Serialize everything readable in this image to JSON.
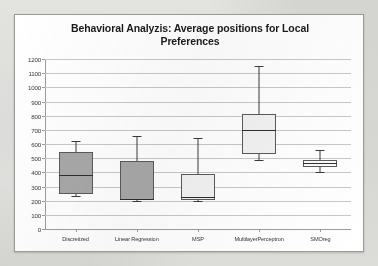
{
  "chart_data": {
    "type": "box",
    "title": "Behavioral Analyzis: Average positions for Local Preferences",
    "xlabel": "",
    "ylabel": "",
    "ylim": [
      0,
      1200
    ],
    "ytick_step": 100,
    "yticks": [
      "1200",
      "1100",
      "1000",
      "900",
      "800",
      "700",
      "600",
      "500",
      "400",
      "300",
      "200",
      "100",
      "0"
    ],
    "grid": true,
    "legend": "none",
    "categories": [
      "Discretized",
      "Linear Regression",
      "MSP",
      "MultilayerPerceptron",
      "SMOreg"
    ],
    "boxes": [
      {
        "name": "Discretized",
        "whisker_low": 230,
        "q1": 245,
        "median": 380,
        "q3": 545,
        "whisker_high": 620,
        "fill": "#a8a8a8"
      },
      {
        "name": "Linear Regression",
        "whisker_low": 200,
        "q1": 205,
        "median": 215,
        "q3": 480,
        "whisker_high": 660,
        "fill": "#a8a8a8"
      },
      {
        "name": "MSP",
        "whisker_low": 195,
        "q1": 205,
        "median": 225,
        "q3": 390,
        "whisker_high": 640,
        "fill": "#f2f2f2"
      },
      {
        "name": "MultilayerPerceptron",
        "whisker_low": 490,
        "q1": 530,
        "median": 700,
        "q3": 810,
        "whisker_high": 1150,
        "fill": "#f2f2f2"
      },
      {
        "name": "SMOreg",
        "whisker_low": 400,
        "q1": 440,
        "median": 465,
        "q3": 490,
        "whisker_high": 560,
        "fill": "#fbfbfb"
      }
    ]
  },
  "colors": {
    "plot_background": "#ffffff",
    "page_background": "#cfcfcb",
    "gridline": "#c8c8c8",
    "axis": "#9d9d9d",
    "box_outline": "#5a5a5a",
    "whisker": "#3b3b3b",
    "title_text": "#1b1b1b",
    "tick_text": "#353535"
  }
}
